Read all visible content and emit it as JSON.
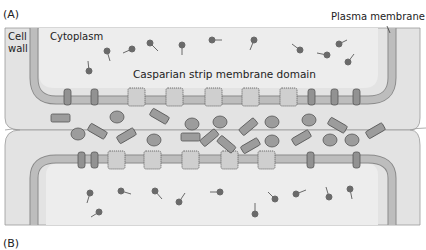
{
  "panel_labels": {
    "a": "(A)",
    "b": "(B)"
  },
  "labels": {
    "cell_wall_line1": "Cell",
    "cell_wall_line2": "wall",
    "cytoplasm": "Cytoplasm",
    "casparian": "Casparian strip membrane domain",
    "plasma_membrane": "Plasma membrane"
  },
  "colors": {
    "background": "#ffffff",
    "cell_wall": "#e2e2e2",
    "cytoplasm": "#ececec",
    "membrane": "#b9b9b9",
    "membrane_edge": "#8a8a8a",
    "protein_dark": "#8f8f8f",
    "protein_light": "#c9c9c9",
    "outline": "#555555",
    "molecule": "#6a6a6a"
  },
  "top_membrane_proteins": [
    {
      "x": 67,
      "type": "narrow"
    },
    {
      "x": 95,
      "type": "narrow"
    },
    {
      "x": 136,
      "type": "wide"
    },
    {
      "x": 174,
      "type": "wide"
    },
    {
      "x": 213,
      "type": "wide"
    },
    {
      "x": 254,
      "type": "wide"
    },
    {
      "x": 292,
      "type": "wide"
    },
    {
      "x": 311,
      "type": "narrow"
    },
    {
      "x": 335,
      "type": "narrow"
    },
    {
      "x": 357,
      "type": "narrow"
    }
  ],
  "bottom_membrane_proteins": [
    {
      "x": 82,
      "type": "narrow"
    },
    {
      "x": 95,
      "type": "narrow"
    },
    {
      "x": 116,
      "type": "wide"
    },
    {
      "x": 153,
      "type": "wide"
    },
    {
      "x": 192,
      "type": "wide"
    },
    {
      "x": 230,
      "type": "wide"
    },
    {
      "x": 267,
      "type": "wide"
    },
    {
      "x": 311,
      "type": "narrow"
    },
    {
      "x": 357,
      "type": "narrow"
    }
  ]
}
